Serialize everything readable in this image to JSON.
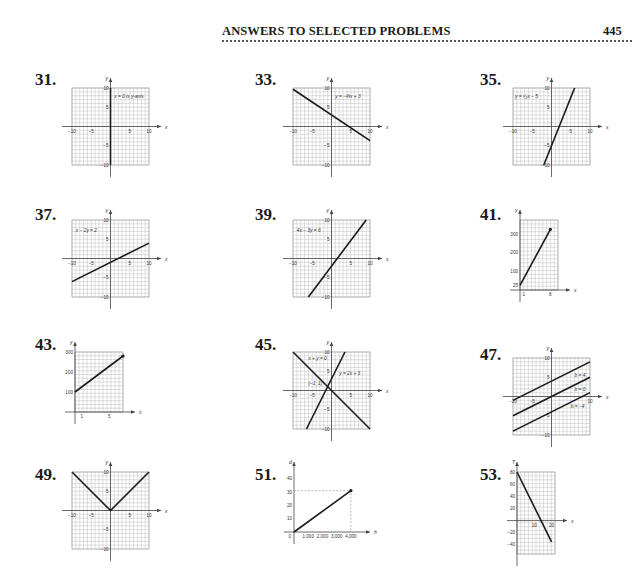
{
  "header": {
    "title": "ANSWERS TO SELECTED PROBLEMS",
    "page_number": "445"
  },
  "chart_data": [
    {
      "id": "31",
      "type": "line",
      "title": "31.",
      "xlabel": "x",
      "ylabel": "y",
      "xlim": [
        -10,
        10
      ],
      "ylim": [
        -10,
        10
      ],
      "grid": true,
      "xticks": [
        -10,
        -5,
        5,
        10
      ],
      "yticks": [
        10,
        5,
        -5,
        -10
      ],
      "series": [
        {
          "name": "x = 0 is y-axis",
          "points": [
            [
              0,
              -10
            ],
            [
              0,
              10
            ]
          ]
        }
      ],
      "annotations": [
        {
          "text": "x = 0 is y-axis",
          "at": [
            1,
            7.5
          ]
        }
      ]
    },
    {
      "id": "33",
      "type": "line",
      "title": "33.",
      "xlabel": "x",
      "ylabel": "y",
      "xlim": [
        -10,
        10
      ],
      "ylim": [
        -10,
        10
      ],
      "grid": true,
      "xticks": [
        -10,
        -5,
        5,
        10
      ],
      "yticks": [
        10,
        5,
        -5,
        -10
      ],
      "series": [
        {
          "name": "y = -(2/3)x + 3",
          "points": [
            [
              -10,
              9.67
            ],
            [
              10,
              -3.67
            ]
          ]
        }
      ],
      "annotations": [
        {
          "text": "y = −⅔x + 3",
          "at": [
            1,
            7.5
          ]
        }
      ]
    },
    {
      "id": "35",
      "type": "line",
      "title": "35.",
      "xlabel": "x",
      "ylabel": "y",
      "xlim": [
        -10,
        10
      ],
      "ylim": [
        -10,
        10
      ],
      "grid": true,
      "xticks": [
        -10,
        -5,
        5,
        10
      ],
      "yticks": [
        10,
        5,
        -5,
        -10
      ],
      "series": [
        {
          "name": "y = (5/2)x - 5",
          "points": [
            [
              -2,
              -10
            ],
            [
              6,
              10
            ]
          ]
        }
      ],
      "annotations": [
        {
          "text": "y = ⁵⁄₂x − 5",
          "at": [
            -9.5,
            7.5
          ]
        }
      ]
    },
    {
      "id": "37",
      "type": "line",
      "title": "37.",
      "xlabel": "x",
      "ylabel": "y",
      "xlim": [
        -10,
        10
      ],
      "ylim": [
        -10,
        10
      ],
      "grid": true,
      "xticks": [
        -10,
        -5,
        5,
        10
      ],
      "yticks": [
        10,
        5,
        -5,
        -10
      ],
      "series": [
        {
          "name": "x - 2y = 2",
          "points": [
            [
              -10,
              -6
            ],
            [
              10,
              4
            ]
          ]
        }
      ],
      "annotations": [
        {
          "text": "x − 2y = 2",
          "at": [
            -9,
            7
          ]
        }
      ]
    },
    {
      "id": "39",
      "type": "line",
      "title": "39.",
      "xlabel": "x",
      "ylabel": "y",
      "xlim": [
        -10,
        10
      ],
      "ylim": [
        -10,
        10
      ],
      "grid": true,
      "xticks": [
        -10,
        -5,
        5,
        10
      ],
      "yticks": [
        10,
        5,
        -5,
        -10
      ],
      "series": [
        {
          "name": "4x - 3y = 6",
          "points": [
            [
              -6,
              -10
            ],
            [
              9,
              10
            ]
          ]
        }
      ],
      "annotations": [
        {
          "text": "4x − 3y = 6",
          "at": [
            -9,
            7
          ]
        }
      ]
    },
    {
      "id": "41",
      "type": "line",
      "title": "41.",
      "xlabel": "x",
      "ylabel": "y",
      "xlim": [
        0,
        10
      ],
      "ylim": [
        0,
        375
      ],
      "grid": true,
      "xticks": [
        1,
        8
      ],
      "yticks": [
        25,
        100,
        200,
        300
      ],
      "series": [
        {
          "name": "segment",
          "points": [
            [
              0,
              25
            ],
            [
              8,
              325
            ]
          ],
          "endpoint": [
            8,
            325
          ]
        }
      ]
    },
    {
      "id": "43",
      "type": "line",
      "title": "43.",
      "xlabel": "x",
      "ylabel": "y",
      "xlim": [
        0,
        7
      ],
      "ylim": [
        0,
        300
      ],
      "grid": true,
      "xticks": [
        1,
        5
      ],
      "yticks": [
        100,
        200,
        300
      ],
      "series": [
        {
          "name": "segment",
          "points": [
            [
              0,
              100
            ],
            [
              7,
              280
            ]
          ],
          "endpoint": [
            7,
            280
          ]
        }
      ]
    },
    {
      "id": "45",
      "type": "line",
      "title": "45.",
      "xlabel": "x",
      "ylabel": "y",
      "xlim": [
        -10,
        10
      ],
      "ylim": [
        -10,
        10
      ],
      "grid": true,
      "xticks": [
        -10,
        -5,
        5,
        10
      ],
      "yticks": [
        10,
        5,
        -5,
        -10
      ],
      "series": [
        {
          "name": "x + y = 0",
          "points": [
            [
              -10,
              10
            ],
            [
              10,
              -10
            ]
          ]
        },
        {
          "name": "y = 2x + 3",
          "points": [
            [
              -6.5,
              -10
            ],
            [
              3.5,
              10
            ]
          ]
        }
      ],
      "annotations": [
        {
          "text": "x + y = 0",
          "at": [
            -6,
            8
          ]
        },
        {
          "text": "y = 2x + 3",
          "at": [
            2,
            4
          ]
        },
        {
          "text": "(−1, 1)",
          "at": [
            -6,
            1.5
          ]
        }
      ]
    },
    {
      "id": "47",
      "type": "line",
      "title": "47.",
      "xlabel": "x",
      "ylabel": "y",
      "xlim": [
        -10,
        10
      ],
      "ylim": [
        -10,
        10
      ],
      "grid": true,
      "xticks": [
        -10,
        -5,
        10
      ],
      "yticks": [
        10,
        5,
        -5,
        -10
      ],
      "series": [
        {
          "name": "b = 4",
          "points": [
            [
              -10,
              -1
            ],
            [
              10,
              9
            ]
          ]
        },
        {
          "name": "b = 0",
          "points": [
            [
              -10,
              -5
            ],
            [
              10,
              5
            ]
          ]
        },
        {
          "name": "b = -4",
          "points": [
            [
              -10,
              -9
            ],
            [
              10,
              1
            ]
          ]
        }
      ],
      "annotations": [
        {
          "text": "b = 4",
          "at": [
            6,
            5
          ]
        },
        {
          "text": "b = 0",
          "at": [
            6,
            1.5
          ]
        },
        {
          "text": "b = −4",
          "at": [
            5,
            -3
          ]
        }
      ]
    },
    {
      "id": "49",
      "type": "line",
      "title": "49.",
      "xlabel": "x",
      "ylabel": "y",
      "xlim": [
        -10,
        10
      ],
      "ylim": [
        -10,
        10
      ],
      "grid": true,
      "xticks": [
        -10,
        -5,
        5,
        10
      ],
      "yticks": [
        10,
        5,
        -5,
        -10
      ],
      "series": [
        {
          "name": "y = |x|",
          "points": [
            [
              -10,
              10
            ],
            [
              0,
              0
            ],
            [
              10,
              10
            ]
          ]
        }
      ]
    },
    {
      "id": "51",
      "type": "line",
      "title": "51.",
      "xlabel": "h",
      "ylabel": "d",
      "xlim": [
        0,
        4500
      ],
      "ylim": [
        0,
        45
      ],
      "grid": false,
      "xticks": [
        1000,
        2000,
        3000,
        4000
      ],
      "xticklabels": [
        "1,000",
        "2,000",
        "3,000",
        "4,000"
      ],
      "yticks": [
        10,
        20,
        30,
        40
      ],
      "origin_label": "0",
      "series": [
        {
          "name": "segment",
          "points": [
            [
              0,
              0
            ],
            [
              4000,
              31
            ]
          ],
          "endpoint": [
            4000,
            31
          ]
        }
      ],
      "guides": [
        [
          4000,
          31
        ]
      ]
    },
    {
      "id": "53",
      "type": "line",
      "title": "53.",
      "xlabel": "x",
      "ylabel": "T",
      "xlim": [
        0,
        22
      ],
      "ylim": [
        -55,
        80
      ],
      "grid": true,
      "xticks": [
        10,
        20
      ],
      "yticks": [
        80,
        60,
        40,
        20,
        -20,
        -40
      ],
      "series": [
        {
          "name": "segment",
          "points": [
            [
              0,
              80
            ],
            [
              20,
              -35
            ]
          ]
        }
      ]
    }
  ]
}
